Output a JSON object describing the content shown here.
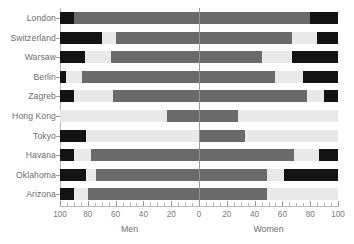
{
  "chart_data": {
    "type": "bar",
    "subtype": "diverging-stacked-population-pyramid",
    "title": "",
    "xlabel": "",
    "ylabel": "",
    "left_axis_title": "Men",
    "right_axis_title": "Women",
    "xlim": [
      -100,
      100
    ],
    "axis_display_ticks": [
      100,
      80,
      60,
      40,
      20,
      0,
      20,
      40,
      60,
      80,
      100
    ],
    "tick_labels_left": [
      "100",
      "80",
      "60",
      "40",
      "20"
    ],
    "tick_label_center": "0",
    "tick_labels_right": [
      "20",
      "40",
      "60",
      "80",
      "100"
    ],
    "minor_tick_step": 5,
    "grid": false,
    "legend": "none",
    "center_line": true,
    "colors": {
      "black": "#131313",
      "dark_gray": "#6a6a6a",
      "light_gray": "#e9e9e9",
      "axis": "#b9b9b9",
      "text": "#6d6d6d"
    },
    "categories": [
      "London",
      "Switzerland",
      "Warsaw",
      "Berlin",
      "Zagreb",
      "Hong Kong",
      "Tokyo",
      "Havana",
      "Oklahoma",
      "Arizona"
    ],
    "rows": [
      {
        "label": "London",
        "men": [
          {
            "color": "black",
            "from": 100,
            "to": 90
          },
          {
            "color": "dark_gray",
            "from": 90,
            "to": 0
          }
        ],
        "women": [
          {
            "color": "dark_gray",
            "from": 0,
            "to": 80
          },
          {
            "color": "black",
            "from": 80,
            "to": 100
          }
        ]
      },
      {
        "label": "Switzerland",
        "men": [
          {
            "color": "black",
            "from": 100,
            "to": 70
          },
          {
            "color": "light_gray",
            "from": 70,
            "to": 60
          },
          {
            "color": "dark_gray",
            "from": 60,
            "to": 0
          }
        ],
        "women": [
          {
            "color": "dark_gray",
            "from": 0,
            "to": 67
          },
          {
            "color": "light_gray",
            "from": 67,
            "to": 85
          },
          {
            "color": "black",
            "from": 85,
            "to": 100
          }
        ]
      },
      {
        "label": "Warsaw",
        "men": [
          {
            "color": "black",
            "from": 100,
            "to": 82
          },
          {
            "color": "light_gray",
            "from": 82,
            "to": 63
          },
          {
            "color": "dark_gray",
            "from": 63,
            "to": 0
          }
        ],
        "women": [
          {
            "color": "dark_gray",
            "from": 0,
            "to": 45
          },
          {
            "color": "light_gray",
            "from": 45,
            "to": 67
          },
          {
            "color": "black",
            "from": 67,
            "to": 100
          }
        ]
      },
      {
        "label": "Berlin",
        "men": [
          {
            "color": "black",
            "from": 100,
            "to": 96
          },
          {
            "color": "light_gray",
            "from": 96,
            "to": 84
          },
          {
            "color": "dark_gray",
            "from": 84,
            "to": 0
          }
        ],
        "women": [
          {
            "color": "dark_gray",
            "from": 0,
            "to": 55
          },
          {
            "color": "light_gray",
            "from": 55,
            "to": 75
          },
          {
            "color": "black",
            "from": 75,
            "to": 100
          }
        ]
      },
      {
        "label": "Zagreb",
        "men": [
          {
            "color": "black",
            "from": 100,
            "to": 90
          },
          {
            "color": "light_gray",
            "from": 90,
            "to": 62
          },
          {
            "color": "dark_gray",
            "from": 62,
            "to": 0
          }
        ],
        "women": [
          {
            "color": "dark_gray",
            "from": 0,
            "to": 78
          },
          {
            "color": "light_gray",
            "from": 78,
            "to": 90
          },
          {
            "color": "black",
            "from": 90,
            "to": 100
          }
        ]
      },
      {
        "label": "Hong Kong",
        "men": [
          {
            "color": "light_gray",
            "from": 100,
            "to": 23
          },
          {
            "color": "dark_gray",
            "from": 23,
            "to": 0
          }
        ],
        "women": [
          {
            "color": "dark_gray",
            "from": 0,
            "to": 28
          },
          {
            "color": "light_gray",
            "from": 28,
            "to": 100
          }
        ]
      },
      {
        "label": "Tokyo",
        "men": [
          {
            "color": "black",
            "from": 100,
            "to": 81
          },
          {
            "color": "light_gray",
            "from": 81,
            "to": 0
          }
        ],
        "women": [
          {
            "color": "dark_gray",
            "from": 0,
            "to": 33
          },
          {
            "color": "light_gray",
            "from": 33,
            "to": 100
          }
        ]
      },
      {
        "label": "Havana",
        "men": [
          {
            "color": "black",
            "from": 100,
            "to": 90
          },
          {
            "color": "light_gray",
            "from": 90,
            "to": 78
          },
          {
            "color": "dark_gray",
            "from": 78,
            "to": 0
          }
        ],
        "women": [
          {
            "color": "dark_gray",
            "from": 0,
            "to": 68
          },
          {
            "color": "light_gray",
            "from": 68,
            "to": 86
          },
          {
            "color": "black",
            "from": 86,
            "to": 100
          }
        ]
      },
      {
        "label": "Oklahoma",
        "men": [
          {
            "color": "black",
            "from": 100,
            "to": 81
          },
          {
            "color": "light_gray",
            "from": 81,
            "to": 74
          },
          {
            "color": "dark_gray",
            "from": 74,
            "to": 0
          }
        ],
        "women": [
          {
            "color": "dark_gray",
            "from": 0,
            "to": 49
          },
          {
            "color": "light_gray",
            "from": 49,
            "to": 61
          },
          {
            "color": "black",
            "from": 61,
            "to": 100
          }
        ]
      },
      {
        "label": "Arizona",
        "men": [
          {
            "color": "black",
            "from": 100,
            "to": 90
          },
          {
            "color": "light_gray",
            "from": 90,
            "to": 80
          },
          {
            "color": "dark_gray",
            "from": 80,
            "to": 0
          }
        ],
        "women": [
          {
            "color": "dark_gray",
            "from": 0,
            "to": 49
          },
          {
            "color": "light_gray",
            "from": 49,
            "to": 100
          }
        ]
      }
    ]
  },
  "layout": {
    "plot_left_px": 60,
    "plot_center_px": 199,
    "plot_right_px": 338,
    "first_row_top_px": 12,
    "row_pitch_px": 19.6,
    "bar_height_px": 12,
    "axis_y_px": 206
  }
}
